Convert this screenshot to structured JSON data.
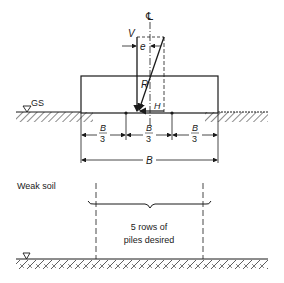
{
  "diagram": {
    "colors": {
      "ink": "#1a1a1a",
      "background": "#ffffff"
    },
    "upper": {
      "centerline_symbol": "℄",
      "labels": {
        "vertical_load": "V",
        "eccentricity": "e",
        "resultant": "R",
        "horizontal_load": "H",
        "ground_surface": "GS"
      },
      "dimensions": {
        "third_numerator": "B",
        "third_denominator": "3",
        "total_width": "B"
      }
    },
    "lower": {
      "soil_label": "Weak soil",
      "note_line1": "5 rows of",
      "note_line2": "piles desired"
    }
  }
}
